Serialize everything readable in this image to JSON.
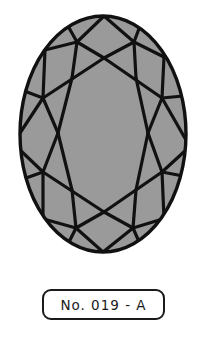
{
  "diagram": {
    "colors": {
      "fill": "#9a9a9a",
      "stroke": "#111111",
      "label_border": "#1a1a1a",
      "label_text": "#1a1a1a",
      "background": "#ffffff"
    }
  },
  "label": {
    "text": "No. 019 - A"
  }
}
